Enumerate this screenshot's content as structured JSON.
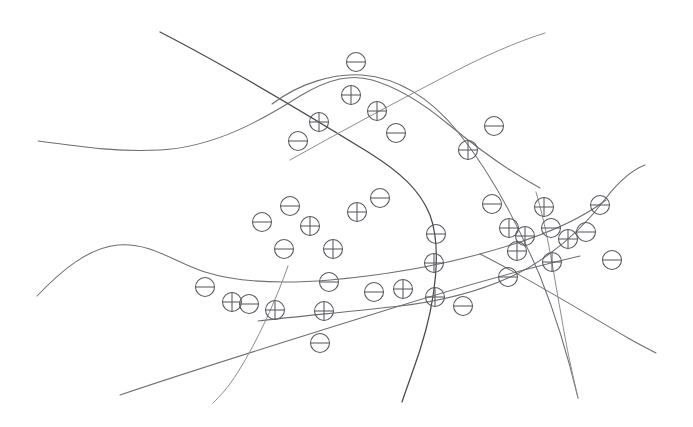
{
  "figure": {
    "width": 693,
    "height": 427,
    "background_color": "#ffffff",
    "stroke_color": "#6e6e74",
    "marker_color": "#58585f",
    "positive_symbol": "circled-plus",
    "negative_symbol": "circled-minus",
    "marker_radius": 9.5,
    "counts": {
      "positive": 19,
      "negative": 21,
      "total": 40,
      "boundaries": 6
    }
  },
  "chart_data": {
    "type": "scatter",
    "xlabel": "",
    "ylabel": "",
    "xlim": [
      0,
      693
    ],
    "ylim": [
      0,
      427
    ],
    "grid": false,
    "legend": null,
    "axes_visible": false,
    "note": "Hand-drawn style figure: circled-plus and circled-minus class markers scattered across regions carved out by six smooth curves.",
    "series": [
      {
        "name": "positive",
        "symbol": "⊕",
        "marker": "circled-plus",
        "count": 19,
        "points": [
          {
            "x": 351,
            "y": 95
          },
          {
            "x": 377,
            "y": 111
          },
          {
            "x": 319,
            "y": 122
          },
          {
            "x": 468,
            "y": 150
          },
          {
            "x": 310,
            "y": 226
          },
          {
            "x": 357,
            "y": 212
          },
          {
            "x": 333,
            "y": 249
          },
          {
            "x": 434,
            "y": 263
          },
          {
            "x": 509,
            "y": 228
          },
          {
            "x": 525,
            "y": 236
          },
          {
            "x": 517,
            "y": 251
          },
          {
            "x": 403,
            "y": 289
          },
          {
            "x": 435,
            "y": 297
          },
          {
            "x": 275,
            "y": 310
          },
          {
            "x": 324,
            "y": 311
          },
          {
            "x": 232,
            "y": 302
          },
          {
            "x": 568,
            "y": 239
          },
          {
            "x": 552,
            "y": 262
          },
          {
            "x": 544,
            "y": 207
          }
        ]
      },
      {
        "name": "negative",
        "symbol": "⊖",
        "marker": "circled-minus",
        "count": 21,
        "points": [
          {
            "x": 356,
            "y": 62
          },
          {
            "x": 298,
            "y": 141
          },
          {
            "x": 396,
            "y": 133
          },
          {
            "x": 494,
            "y": 126
          },
          {
            "x": 290,
            "y": 206
          },
          {
            "x": 380,
            "y": 198
          },
          {
            "x": 436,
            "y": 234
          },
          {
            "x": 492,
            "y": 204
          },
          {
            "x": 551,
            "y": 228
          },
          {
            "x": 329,
            "y": 282
          },
          {
            "x": 374,
            "y": 292
          },
          {
            "x": 249,
            "y": 304
          },
          {
            "x": 463,
            "y": 306
          },
          {
            "x": 508,
            "y": 277
          },
          {
            "x": 320,
            "y": 343
          },
          {
            "x": 586,
            "y": 232
          },
          {
            "x": 600,
            "y": 205
          },
          {
            "x": 612,
            "y": 260
          },
          {
            "x": 284,
            "y": 249
          },
          {
            "x": 205,
            "y": 287
          },
          {
            "x": 262,
            "y": 222
          }
        ]
      }
    ]
  },
  "curves": [
    {
      "name": "upper-left-s-curve",
      "description": "Long wavy curve entering at left edge, dipping then rising to a crest near the top centre and descending to the right edge.",
      "style": "normal",
      "path": "M 38 141 C 90 148 120 152 160 150 C 215 147 262 120 300 96 C 330 78 352 74 372 80 C 400 88 424 104 448 124 C 476 147 505 169 540 188"
    },
    {
      "name": "top-dark-diagonal",
      "description": "Dark straight diagonal descending from upper-left toward the lower-right, crossing the upper crest.",
      "style": "dark",
      "path": "M 160 32 C 230 68 300 110 368 152 C 400 172 420 190 430 215 C 442 248 436 300 420 350 C 412 374 406 390 402 402"
    },
    {
      "name": "top-right-rising-diagonal",
      "description": "Straight line rising from the middle-left of the canvas to the upper-right.",
      "style": "faint",
      "path": "M 290 160 C 340 132 392 104 444 77 C 482 57 516 42 545 33"
    },
    {
      "name": "centre-arc",
      "description": "Broad arc cresting near the top centre and sweeping down to the right, bounding the dense marker cluster.",
      "style": "normal",
      "path": "M 272 104 C 300 83 334 73 362 75 C 400 78 432 100 458 132 C 488 169 516 220 540 276 C 556 316 568 356 578 398"
    },
    {
      "name": "lower-left-wave",
      "description": "S-shaped wave along the lower-left, rising to a hump then flattening toward the right edge.",
      "style": "normal",
      "path": "M 37 296 C 62 270 88 248 118 245 C 150 242 174 262 205 272 C 240 283 282 284 330 280 C 386 275 440 265 480 254 C 540 238 580 220 606 200"
    },
    {
      "name": "lower-right-descending-arc",
      "description": "Arc rising from the left of the lower band, cresting near the right and falling to the lower-right corner.",
      "style": "normal",
      "path": "M 258 321 C 300 316 348 312 400 306 C 450 300 492 288 528 268 C 562 248 588 222 606 198 C 620 180 632 170 645 165"
    },
    {
      "name": "bottom-left-straight",
      "description": "Straight line rising from the lower-left edge toward the right, passing under the dense cluster.",
      "style": "normal",
      "path": "M 120 395 C 200 368 290 340 380 312 C 450 290 520 270 580 256"
    },
    {
      "name": "bottom-centre-descender",
      "description": "Curve descending steeply through the lower-centre toward the bottom edge.",
      "style": "faint",
      "path": "M 288 266 C 276 300 258 340 238 372 C 228 388 220 396 213 403"
    },
    {
      "name": "right-descending-tail",
      "description": "Long shallow line descending from the mid-right to the right edge near the bottom.",
      "style": "normal",
      "path": "M 480 254 C 528 278 580 310 628 338 C 642 346 650 350 656 353"
    },
    {
      "name": "right-steep-descender",
      "description": "Steep curve falling from the cluster on the right toward the bottom-right.",
      "style": "faint",
      "path": "M 536 192 C 548 232 554 276 562 320 C 568 356 574 380 578 398"
    }
  ]
}
